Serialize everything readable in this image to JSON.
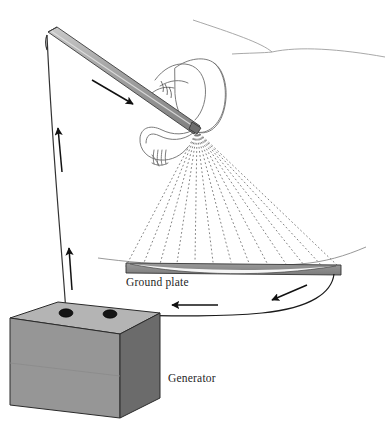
{
  "figure": {
    "background_color": "#ffffff",
    "width": 385,
    "height": 434,
    "labels": {
      "ground_plate": "Ground plate",
      "generator": "Generator"
    },
    "label_color": "#262626",
    "components": [
      {
        "name": "spray-wand",
        "description": "Gray cylindrical spray wand / lance held by a gloved hand, angled down to the right",
        "fill": "#9a9a9a",
        "stroke": "#3c3c3c"
      },
      {
        "name": "hand",
        "description": "Outline drawing of a hand and shirt cuff gripping the wand",
        "stroke": "#6e6e6e"
      },
      {
        "name": "spray-fan",
        "description": "Fan of dotted lines representing charged powder particles sprayed toward the ground plate",
        "ray_count": 13,
        "stroke": "#6b6b6b",
        "style": "dotted"
      },
      {
        "name": "ground-plate",
        "description": "Flat horizontal grounded target plate with a lens-shaped highlight",
        "fill": "#8e8e8e",
        "stroke": "#3c3c3c"
      },
      {
        "name": "generator",
        "description": "High voltage generator drawn as a gray cube with two terminal posts on the top face",
        "top_fill": "#b4b4b4",
        "front_fill": "#969696",
        "side_fill": "#6b6b6b",
        "stroke": "#2a2a2a"
      },
      {
        "name": "supply-cable",
        "description": "Cable running from the left generator terminal up to the wand, with two arrows showing current flow upward",
        "stroke": "#333333"
      },
      {
        "name": "return-cable",
        "description": "Cable curving from the right end of the ground plate back to the right generator terminal, with two arrows showing return flow leftward",
        "stroke": "#1a1a1a"
      },
      {
        "name": "horizon-lines",
        "description": "Two faint background contour lines suggesting a horizon behind the operator",
        "stroke": "#9a9a9a"
      },
      {
        "name": "wand-direction-arrow",
        "description": "Solid arrow along the wand pointing down-right toward the nozzle",
        "fill": "#111111"
      }
    ],
    "spray": {
      "origin": {
        "x": 197,
        "y": 131
      },
      "rays": [
        {
          "end_x": 126,
          "end_y": 266
        },
        {
          "end_x": 143,
          "end_y": 265
        },
        {
          "end_x": 160,
          "end_y": 264
        },
        {
          "end_x": 177,
          "end_y": 263
        },
        {
          "end_x": 195,
          "end_y": 262
        },
        {
          "end_x": 213,
          "end_y": 262
        },
        {
          "end_x": 231,
          "end_y": 262
        },
        {
          "end_x": 249,
          "end_y": 263
        },
        {
          "end_x": 267,
          "end_y": 263
        },
        {
          "end_x": 286,
          "end_y": 264
        },
        {
          "end_x": 304,
          "end_y": 265
        },
        {
          "end_x": 322,
          "end_y": 266
        },
        {
          "end_x": 339,
          "end_y": 267
        }
      ]
    },
    "ground_plate_geometry": {
      "left_x": 126,
      "right_x": 341,
      "top_y": 263,
      "bottom_y": 273
    },
    "generator_geometry": {
      "top_face": "(10,318) (58,302) (160,313) (120,334)",
      "front_face": "(10,318) (120,334) (120,418) (10,405)",
      "side_face": "(120,334) (160,313) (160,398) (120,418)",
      "terminals": [
        {
          "x": 66,
          "y": 313,
          "rx": 7,
          "ry": 4
        },
        {
          "x": 110,
          "y": 314,
          "rx": 7,
          "ry": 4
        }
      ]
    }
  }
}
